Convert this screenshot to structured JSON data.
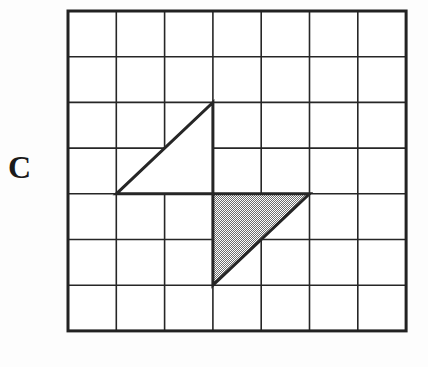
{
  "figure": {
    "label": "C",
    "caption": "",
    "background_color": "#fdfdfd",
    "line_color": "#262626",
    "shade_color": "#a9a9a9",
    "white_fill": "#ffffff"
  },
  "chart_data": {
    "type": "diagram",
    "title": "C",
    "subtitle": "",
    "xlabel": "",
    "ylabel": "",
    "grid": true,
    "legend_position": "none",
    "axis": {
      "columns": 7,
      "rows": 7,
      "xlim": [
        0,
        7
      ],
      "ylim": [
        0,
        7
      ],
      "xticks": [
        0,
        1,
        2,
        3,
        4,
        5,
        6,
        7
      ],
      "yticks": [
        0,
        1,
        2,
        3,
        4,
        5,
        6,
        7
      ],
      "xtick_labels": [
        "",
        "",
        "",
        "",
        "",
        "",
        "",
        ""
      ],
      "ytick_labels": [
        "",
        "",
        "",
        "",
        "",
        "",
        "",
        ""
      ],
      "cell_width_px": 48.3,
      "cell_height_px": 45.7,
      "origin_px": [
        68,
        11
      ],
      "border_width_px": 3,
      "gridline_width_px": 1.6
    },
    "shapes": [
      {
        "name": "unshaded-triangle",
        "kind": "triangle",
        "fill": "none",
        "fill_label": "white",
        "stroke": "#262626",
        "stroke_width_px": 3,
        "vertices_grid": [
          [
            1,
            4
          ],
          [
            3,
            2
          ],
          [
            3,
            4
          ]
        ],
        "vertices_px": [
          [
            116,
            193
          ],
          [
            213,
            102
          ],
          [
            213,
            193
          ]
        ],
        "legs_units": [
          2,
          2
        ],
        "right_angle_at_grid": [
          3,
          4
        ],
        "area_units": 2
      },
      {
        "name": "shaded-triangle",
        "kind": "triangle",
        "fill": "#a9a9a9",
        "fill_label": "shaded",
        "stroke": "#262626",
        "stroke_width_px": 3,
        "vertices_grid": [
          [
            3,
            4
          ],
          [
            5,
            4
          ],
          [
            3,
            6
          ]
        ],
        "vertices_px": [
          [
            213,
            193
          ],
          [
            309,
            193
          ],
          [
            213,
            285
          ]
        ],
        "legs_units": [
          2,
          2
        ],
        "right_angle_at_grid": [
          3,
          4
        ],
        "area_units": 2
      }
    ],
    "annotations": [
      {
        "name": "figure-label",
        "text": "C",
        "position_px": [
          12,
          167
        ]
      }
    ]
  }
}
